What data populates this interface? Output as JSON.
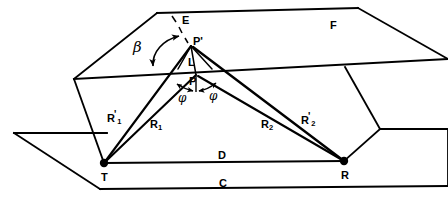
{
  "figure": {
    "type": "line-diagram",
    "stroke_color": "#000000",
    "background_color": "#ffffff",
    "width": 448,
    "height": 205
  },
  "labels": {
    "plane_upper": "F",
    "plane_lower": "C",
    "normal_line": "E",
    "point_image": "P'",
    "point_L": "L",
    "point_P": "P",
    "angle_beta": "β",
    "angle_phi_left": "φ",
    "angle_phi_right": "φ",
    "ray_R1_prime": "R",
    "ray_R1_prime_sub": "1",
    "ray_R1_prime_mark": "'",
    "ray_R1": "R",
    "ray_R1_sub": "1",
    "ray_R2": "R",
    "ray_R2_sub": "2",
    "ray_R2_prime": "R",
    "ray_R2_prime_sub": "2",
    "ray_R2_prime_mark": "'",
    "baseline_D": "D",
    "node_transmitter": "T",
    "node_receiver": "R"
  },
  "nodes": [
    {
      "name": "transmitter",
      "label": "T",
      "x": 104,
      "y": 163
    },
    {
      "name": "receiver",
      "label": "R",
      "x": 344,
      "y": 161
    },
    {
      "name": "image-point",
      "label": "P'",
      "x": 191,
      "y": 45
    },
    {
      "name": "reflection-point",
      "label": "P",
      "x": 196,
      "y": 74
    }
  ],
  "geometry": {
    "upper_plane_points": "157,13 358,8 448,59 245,66",
    "lower_plane_points": "14,133 107,133 148,188 448,186 448,183 380,129 448,129",
    "lower_plane_outline": "14,133 107,133 148,188 448,189",
    "upper_plane_front_edge": "74,79 245,66 448,59",
    "left_wall": "74,79 157,13",
    "left_wall_down": "74,79 104,163",
    "right_wall": "358,8 448,59",
    "right_wall_down": "345,67 380,129 344,161",
    "baseline": "104,163 344,161"
  }
}
